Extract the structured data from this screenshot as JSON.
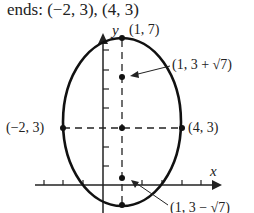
{
  "title": "ends:  (−2, 3), (4, 3)",
  "axes": {
    "x_label": "x",
    "y_label": "y"
  },
  "points": {
    "top": "(1, 7)",
    "focus_upper": "(1, 3 + √7)",
    "left_end": "(−2, 3)",
    "right_end": "(4, 3)",
    "focus_lower": "(1, 3 − √7)"
  },
  "colors": {
    "stroke": "#111111",
    "background": "#ffffff"
  }
}
